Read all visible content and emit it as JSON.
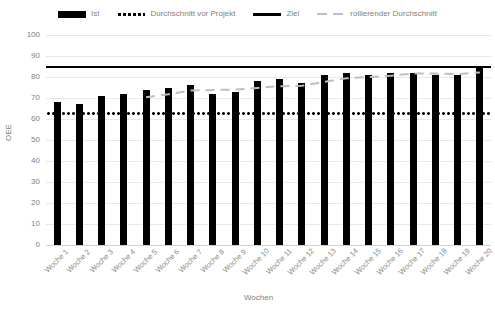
{
  "chart_data": {
    "type": "bar",
    "title": "",
    "xlabel": "Wochen",
    "ylabel": "OEE",
    "ylim": [
      0,
      100
    ],
    "ytick_step": 10,
    "yticks": [
      100,
      90,
      80,
      70,
      60,
      50,
      40,
      30,
      20,
      10,
      0
    ],
    "grid": true,
    "legend_position": "top",
    "categories": [
      "Woche 1",
      "Woche 2",
      "Woche 3",
      "Woche 4",
      "Woche 5",
      "Woche 6",
      "Woche 7",
      "Woche 8",
      "Woche 9",
      "Woche 10",
      "Woche 11",
      "Woche 12",
      "Woche 13",
      "Woche 14",
      "Woche 15",
      "Woche 16",
      "Woche 17",
      "Woche 18",
      "Woche 19",
      "Woche 20"
    ],
    "series": [
      {
        "name": "Ist",
        "type": "bar",
        "color": "#000000",
        "values": [
          68,
          67,
          71,
          72,
          74,
          75,
          76,
          72,
          73,
          78,
          79,
          77,
          81,
          82,
          81,
          82,
          82,
          81,
          81,
          85
        ]
      },
      {
        "name": "Durchschnitt vor Projekt",
        "type": "line",
        "style": "dotted",
        "color": "#000000",
        "constant": 63
      },
      {
        "name": "Ziel",
        "type": "line",
        "style": "solid",
        "color": "#000000",
        "constant": 85
      },
      {
        "name": "rollierender Durchschnitt",
        "type": "line",
        "style": "dashed",
        "color": "#bfbfbf",
        "values": [
          null,
          null,
          null,
          null,
          70.4,
          71.8,
          73.6,
          73.8,
          74.0,
          74.8,
          75.6,
          75.8,
          77.6,
          79.4,
          80.0,
          80.6,
          81.6,
          81.6,
          81.4,
          82.2
        ]
      }
    ]
  },
  "legend": {
    "items": [
      {
        "label": "Ist",
        "swatch": "bar-swatch"
      },
      {
        "label": "Durchschnitt vor Projekt",
        "swatch": "dotted-line-swatch"
      },
      {
        "label": "Ziel",
        "swatch": "solid-line-swatch"
      },
      {
        "label": "rollierender Durchschnitt",
        "swatch": "dashed-line-swatch"
      }
    ]
  }
}
